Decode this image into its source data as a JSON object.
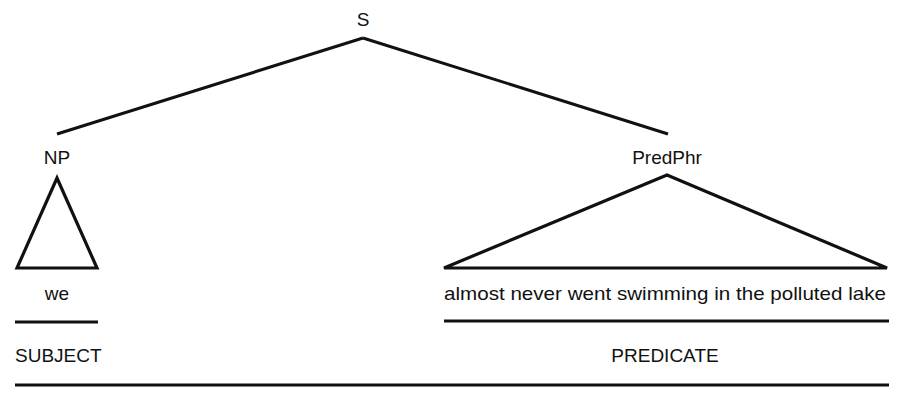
{
  "tree": {
    "root": {
      "label": "S"
    },
    "left_node": {
      "label": "NP",
      "leaf": "we",
      "role": "SUBJECT"
    },
    "right_node": {
      "label": "PredPhr",
      "leaf": "almost never went swimming in the polluted lake",
      "role": "PREDICATE"
    }
  }
}
